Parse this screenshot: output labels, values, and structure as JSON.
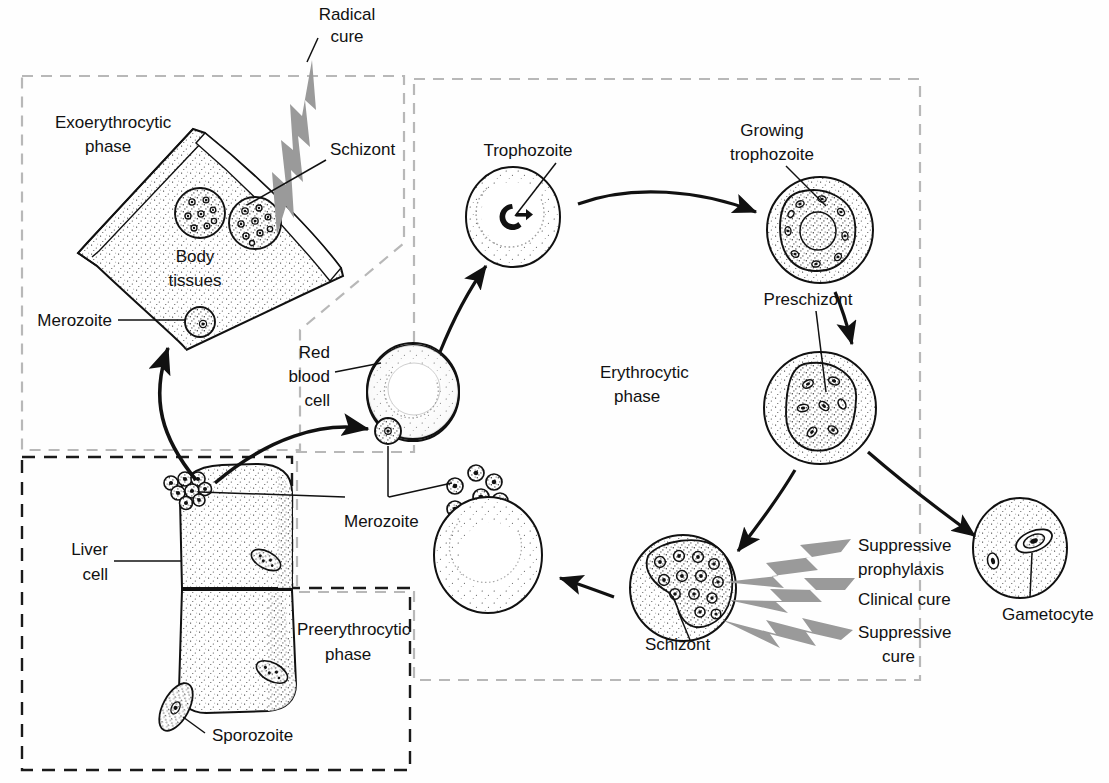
{
  "diagram": {
    "type": "biological-lifecycle-diagram",
    "colors": {
      "ink": "#111111",
      "lightning": "#9a9a9a",
      "stipple": "#2b2b2b",
      "dash_dark": "#1a1a1a",
      "dash_light": "#b8b8b8",
      "background": "#fefefe"
    }
  },
  "phases": [
    {
      "id": "exoerythrocytic",
      "label_line1": "Exoerythrocytic",
      "label_line2": "phase",
      "border_style": "light-dashed"
    },
    {
      "id": "preerythrocytic",
      "label_line1": "Preerythrocytic",
      "label_line2": "phase",
      "border_style": "dark-dashed"
    },
    {
      "id": "erythrocytic",
      "label_line1": "Erythrocytic",
      "label_line2": "phase",
      "border_style": "light-dashed"
    }
  ],
  "labels": {
    "radical_cure_line1": "Radical",
    "radical_cure_line2": "cure",
    "schizont_exo": "Schizont",
    "body_tissues_line1": "Body",
    "body_tissues_line2": "tissues",
    "merozoite_exo": "Merozoite",
    "liver_cell_line1": "Liver",
    "liver_cell_line2": "cell",
    "sporozoite": "Sporozoite",
    "merozoite_center": "Merozoite",
    "red_blood_cell_line1": "Red",
    "red_blood_cell_line2": "blood",
    "red_blood_cell_line3": "cell",
    "trophozoite": "Trophozoite",
    "growing_trophozoite_line1": "Growing",
    "growing_trophozoite_line2": "trophozoite",
    "preschizont": "Preschizont",
    "schizont_ery": "Schizont",
    "suppressive_prophylaxis_line1": "Suppressive",
    "suppressive_prophylaxis_line2": "prophylaxis",
    "clinical_cure": "Clinical cure",
    "suppressive_cure_line1": "Suppressive",
    "suppressive_cure_line2": "cure",
    "gametocyte": "Gametocyte"
  },
  "treatments": [
    {
      "name": "Radical cure",
      "targets": "Exoerythrocytic schizont"
    },
    {
      "name": "Suppressive prophylaxis",
      "targets": "Erythrocytic schizont"
    },
    {
      "name": "Clinical cure",
      "targets": "Erythrocytic schizont"
    },
    {
      "name": "Suppressive cure",
      "targets": "Erythrocytic schizont"
    }
  ],
  "stages": [
    {
      "name": "Sporozoite",
      "phase": "preerythrocytic"
    },
    {
      "name": "Liver cell",
      "phase": "preerythrocytic"
    },
    {
      "name": "Merozoite",
      "phase": "preerythrocytic"
    },
    {
      "name": "Schizont",
      "phase": "exoerythrocytic"
    },
    {
      "name": "Body tissues",
      "phase": "exoerythrocytic"
    },
    {
      "name": "Red blood cell",
      "phase": "erythrocytic"
    },
    {
      "name": "Trophozoite",
      "phase": "erythrocytic"
    },
    {
      "name": "Growing trophozoite",
      "phase": "erythrocytic"
    },
    {
      "name": "Preschizont",
      "phase": "erythrocytic"
    },
    {
      "name": "Schizont",
      "phase": "erythrocytic"
    },
    {
      "name": "Gametocyte",
      "phase": "erythrocytic"
    }
  ]
}
